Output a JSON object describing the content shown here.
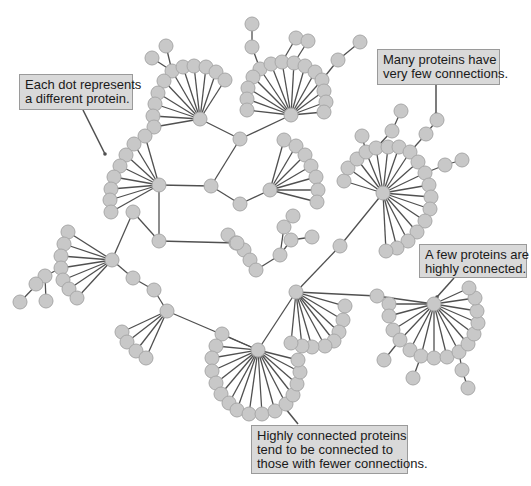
{
  "colors": {
    "node_fill": "#c8c8c8",
    "node_stroke": "#a8a8a8",
    "edge": "#505050",
    "callout_bg": "#d9d9d9",
    "callout_border": "#9a9a9a",
    "pointer": "#505050"
  },
  "callouts": [
    {
      "id": "each-dot",
      "lines": [
        "Each dot represents",
        "a different protein."
      ],
      "x": 19,
      "y": 74,
      "w": 114,
      "h": 36,
      "pointer": [
        [
          83,
          110
        ],
        [
          105,
          154
        ]
      ]
    },
    {
      "id": "many-proteins",
      "lines": [
        "Many proteins have",
        "very few connections."
      ],
      "x": 377,
      "y": 49,
      "w": 123,
      "h": 36,
      "pointer": [
        [
          436,
          85
        ],
        [
          436,
          114
        ]
      ]
    },
    {
      "id": "few-proteins",
      "lines": [
        "A few proteins are",
        "highly connected."
      ],
      "x": 419,
      "y": 244,
      "w": 108,
      "h": 34,
      "pointer": [
        [
          454,
          278
        ],
        [
          437,
          297
        ]
      ]
    },
    {
      "id": "highly-connected",
      "lines": [
        "Highly connected proteins",
        "tend to be connected to",
        "those with fewer connections."
      ],
      "x": 251,
      "y": 425,
      "w": 157,
      "h": 49,
      "pointer": [
        [
          298,
          424
        ],
        [
          285,
          408
        ]
      ]
    }
  ],
  "graph": {
    "node_radius": 7,
    "hubs": [
      {
        "id": "A",
        "x": 200,
        "y": 119,
        "leaves": [
          [
            172,
            71
          ],
          [
            183,
            67
          ],
          [
            194,
            66
          ],
          [
            206,
            67
          ],
          [
            216,
            72
          ],
          [
            225,
            80
          ],
          [
            164,
            81
          ],
          [
            158,
            93
          ],
          [
            155,
            104
          ],
          [
            153,
            116
          ],
          [
            154,
            127
          ]
        ]
      },
      {
        "id": "B",
        "x": 291,
        "y": 115,
        "leaves": [
          [
            260,
            69
          ],
          [
            271,
            64
          ],
          [
            282,
            62
          ],
          [
            294,
            63
          ],
          [
            305,
            66
          ],
          [
            315,
            72
          ],
          [
            322,
            80
          ],
          [
            253,
            77
          ],
          [
            248,
            88
          ],
          [
            247,
            99
          ],
          [
            247,
            110
          ],
          [
            324,
            91
          ],
          [
            326,
            102
          ],
          [
            324,
            112
          ]
        ]
      },
      {
        "id": "C",
        "x": 159,
        "y": 185,
        "leaves": [
          [
            145,
            136
          ],
          [
            134,
            144
          ],
          [
            126,
            155
          ],
          [
            120,
            166
          ],
          [
            114,
            177
          ],
          [
            111,
            189
          ],
          [
            110,
            200
          ],
          [
            111,
            212
          ]
        ]
      },
      {
        "id": "D",
        "x": 270,
        "y": 190,
        "leaves": [
          [
            284,
            140
          ],
          [
            296,
            146
          ],
          [
            305,
            155
          ],
          [
            311,
            166
          ],
          [
            316,
            177
          ],
          [
            318,
            190
          ],
          [
            317,
            202
          ]
        ]
      },
      {
        "id": "E",
        "x": 383,
        "y": 193,
        "leaves": [
          [
            344,
            181
          ],
          [
            348,
            168
          ],
          [
            357,
            159
          ],
          [
            366,
            152
          ],
          [
            376,
            148
          ],
          [
            388,
            147
          ],
          [
            399,
            147
          ],
          [
            410,
            152
          ],
          [
            418,
            162
          ],
          [
            425,
            173
          ],
          [
            429,
            185
          ],
          [
            431,
            197
          ],
          [
            430,
            209
          ],
          [
            425,
            221
          ],
          [
            417,
            232
          ],
          [
            408,
            241
          ],
          [
            397,
            248
          ],
          [
            386,
            251
          ]
        ]
      },
      {
        "id": "F",
        "x": 112,
        "y": 260,
        "leaves": [
          [
            68,
            232
          ],
          [
            64,
            244
          ],
          [
            61,
            256
          ],
          [
            61,
            268
          ],
          [
            63,
            280
          ],
          [
            69,
            289
          ],
          [
            77,
            298
          ]
        ]
      },
      {
        "id": "G",
        "x": 167,
        "y": 311,
        "leaves": [
          [
            122,
            332
          ],
          [
            127,
            342
          ],
          [
            136,
            351
          ],
          [
            146,
            358
          ]
        ]
      },
      {
        "id": "H",
        "x": 237,
        "y": 243,
        "leaves": [
          [
            228,
            235
          ],
          [
            236,
            243
          ],
          [
            244,
            250
          ],
          [
            250,
            260
          ],
          [
            256,
            270
          ]
        ]
      },
      {
        "id": "I",
        "x": 296,
        "y": 292,
        "leaves": [
          [
            345,
            306
          ],
          [
            343,
            320
          ],
          [
            339,
            332
          ],
          [
            334,
            341
          ],
          [
            325,
            346
          ],
          [
            312,
            347
          ],
          [
            302,
            346
          ],
          [
            291,
            343
          ]
        ]
      },
      {
        "id": "J",
        "x": 258,
        "y": 350,
        "leaves": [
          [
            222,
            334
          ],
          [
            216,
            346
          ],
          [
            212,
            358
          ],
          [
            212,
            371
          ],
          [
            216,
            383
          ],
          [
            221,
            394
          ],
          [
            229,
            403
          ],
          [
            237,
            410
          ],
          [
            249,
            414
          ],
          [
            262,
            414
          ],
          [
            275,
            411
          ],
          [
            286,
            404
          ],
          [
            293,
            395
          ],
          [
            297,
            384
          ],
          [
            300,
            372
          ],
          [
            298,
            360
          ]
        ]
      },
      {
        "id": "K",
        "x": 434,
        "y": 304,
        "leaves": [
          [
            389,
            304
          ],
          [
            389,
            316
          ],
          [
            393,
            330
          ],
          [
            400,
            340
          ],
          [
            410,
            350
          ],
          [
            421,
            356
          ],
          [
            434,
            358
          ],
          [
            447,
            357
          ],
          [
            459,
            352
          ],
          [
            468,
            344
          ],
          [
            474,
            334
          ],
          [
            478,
            323
          ],
          [
            477,
            311
          ],
          [
            475,
            298
          ],
          [
            469,
            288
          ]
        ]
      }
    ],
    "links": [
      [
        [
          200,
          119
        ],
        [
          240,
          139
        ]
      ],
      [
        [
          240,
          139
        ],
        [
          291,
          115
        ]
      ],
      [
        [
          240,
          139
        ],
        [
          211,
          186
        ]
      ],
      [
        [
          211,
          186
        ],
        [
          159,
          185
        ]
      ],
      [
        [
          211,
          186
        ],
        [
          240,
          204
        ]
      ],
      [
        [
          240,
          204
        ],
        [
          270,
          190
        ]
      ],
      [
        [
          159,
          185
        ],
        [
          159,
          241
        ]
      ],
      [
        [
          159,
          241
        ],
        [
          237,
          243
        ]
      ],
      [
        [
          159,
          241
        ],
        [
          133,
          212
        ]
      ],
      [
        [
          133,
          212
        ],
        [
          112,
          260
        ]
      ],
      [
        [
          112,
          260
        ],
        [
          133,
          278
        ]
      ],
      [
        [
          133,
          278
        ],
        [
          154,
          290
        ]
      ],
      [
        [
          154,
          290
        ],
        [
          167,
          311
        ]
      ],
      [
        [
          167,
          311
        ],
        [
          258,
          350
        ]
      ],
      [
        [
          258,
          350
        ],
        [
          296,
          292
        ]
      ],
      [
        [
          296,
          292
        ],
        [
          340,
          246
        ]
      ],
      [
        [
          340,
          246
        ],
        [
          383,
          193
        ]
      ],
      [
        [
          296,
          292
        ],
        [
          377,
          296
        ]
      ],
      [
        [
          377,
          296
        ],
        [
          434,
          304
        ]
      ]
    ],
    "extra_nodes": [
      {
        "from": [
          172,
          71
        ],
        "to": [
          152,
          58
        ]
      },
      {
        "from": [
          172,
          71
        ],
        "to": [
          166,
          46
        ]
      },
      {
        "from": [
          260,
          69
        ],
        "to": [
          252,
          47
        ]
      },
      {
        "from": [
          252,
          47
        ],
        "to": [
          252,
          24
        ]
      },
      {
        "from": [
          282,
          62
        ],
        "to": [
          296,
          38
        ]
      },
      {
        "from": [
          294,
          63
        ],
        "to": [
          308,
          41
        ]
      },
      {
        "from": [
          322,
          80
        ],
        "to": [
          338,
          60
        ]
      },
      {
        "from": [
          338,
          60
        ],
        "to": [
          360,
          42
        ]
      },
      {
        "from": [
          366,
          152
        ],
        "to": [
          362,
          136
        ]
      },
      {
        "from": [
          376,
          148
        ],
        "to": [
          392,
          131
        ]
      },
      {
        "from": [
          392,
          131
        ],
        "to": [
          401,
          111
        ]
      },
      {
        "from": [
          410,
          152
        ],
        "to": [
          426,
          134
        ]
      },
      {
        "from": [
          426,
          134
        ],
        "to": [
          437,
          120
        ]
      },
      {
        "from": [
          425,
          173
        ],
        "to": [
          445,
          165
        ]
      },
      {
        "from": [
          445,
          165
        ],
        "to": [
          462,
          160
        ]
      },
      {
        "from": [
          256,
          270
        ],
        "to": [
          280,
          255
        ]
      },
      {
        "from": [
          280,
          255
        ],
        "to": [
          284,
          227
        ]
      },
      {
        "from": [
          284,
          227
        ],
        "to": [
          293,
          216
        ]
      },
      {
        "from": [
          280,
          255
        ],
        "to": [
          291,
          240
        ]
      },
      {
        "from": [
          291,
          240
        ],
        "to": [
          312,
          237
        ]
      },
      {
        "from": [
          61,
          268
        ],
        "to": [
          45,
          276
        ]
      },
      {
        "from": [
          45,
          276
        ],
        "to": [
          36,
          284
        ]
      },
      {
        "from": [
          45,
          276
        ],
        "to": [
          20,
          302
        ]
      },
      {
        "from": [
          45,
          276
        ],
        "to": [
          46,
          301
        ]
      },
      {
        "from": [
          400,
          340
        ],
        "to": [
          384,
          360
        ]
      },
      {
        "from": [
          421,
          356
        ],
        "to": [
          413,
          378
        ]
      },
      {
        "from": [
          459,
          352
        ],
        "to": [
          462,
          370
        ]
      },
      {
        "from": [
          462,
          370
        ],
        "to": [
          468,
          388
        ]
      }
    ]
  }
}
